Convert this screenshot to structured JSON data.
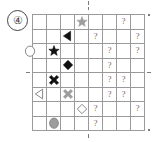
{
  "panel": {
    "label": "④",
    "number": 4
  },
  "grid": {
    "rows": 8,
    "cols": 8,
    "line_color": "#9a9a9a",
    "background": "#ffffff"
  },
  "symbols": {
    "question_mark": "?",
    "question_color": "#6e6e6e",
    "fill_black": "#111111",
    "fill_gray": "#9d9d9d",
    "fill_white": "#ffffff",
    "stroke": "#7a7a7a"
  },
  "cells": [
    {
      "row": 1,
      "col": 4,
      "kind": "star",
      "fill": "gray",
      "name": "gray-star-icon"
    },
    {
      "row": 1,
      "col": 7,
      "kind": "question",
      "text": "?",
      "name": "question-mark"
    },
    {
      "row": 2,
      "col": 3,
      "kind": "triangle-left",
      "fill": "black",
      "name": "black-left-triangle-icon"
    },
    {
      "row": 2,
      "col": 5,
      "kind": "question",
      "text": "?",
      "name": "question-mark"
    },
    {
      "row": 2,
      "col": 8,
      "kind": "question",
      "text": "?",
      "name": "question-mark"
    },
    {
      "row": 3,
      "col": 1,
      "kind": "oval-clipped",
      "fill": "white",
      "name": "white-oval-icon"
    },
    {
      "row": 3,
      "col": 2,
      "kind": "star",
      "fill": "black",
      "name": "black-star-icon"
    },
    {
      "row": 3,
      "col": 6,
      "kind": "question",
      "text": "?",
      "name": "question-mark"
    },
    {
      "row": 3,
      "col": 8,
      "kind": "question",
      "text": "?",
      "name": "question-mark"
    },
    {
      "row": 4,
      "col": 3,
      "kind": "diamond",
      "fill": "black",
      "name": "black-diamond-icon"
    },
    {
      "row": 4,
      "col": 6,
      "kind": "question",
      "text": "?",
      "name": "question-mark"
    },
    {
      "row": 5,
      "col": 2,
      "kind": "cross-x",
      "fill": "black",
      "name": "black-x-cross-icon"
    },
    {
      "row": 5,
      "col": 6,
      "kind": "question",
      "text": "?",
      "name": "question-mark"
    },
    {
      "row": 5,
      "col": 7,
      "kind": "question",
      "text": "?",
      "name": "question-mark"
    },
    {
      "row": 6,
      "col": 1,
      "kind": "triangle-left",
      "fill": "white",
      "name": "white-left-triangle-icon"
    },
    {
      "row": 6,
      "col": 3,
      "kind": "cross-x",
      "fill": "gray",
      "name": "gray-x-cross-icon"
    },
    {
      "row": 6,
      "col": 6,
      "kind": "question",
      "text": "?",
      "name": "question-mark"
    },
    {
      "row": 6,
      "col": 7,
      "kind": "question",
      "text": "?",
      "name": "question-mark"
    },
    {
      "row": 7,
      "col": 4,
      "kind": "diamond",
      "fill": "white",
      "name": "white-diamond-icon"
    },
    {
      "row": 7,
      "col": 5,
      "kind": "question",
      "text": "?",
      "name": "question-mark"
    },
    {
      "row": 7,
      "col": 8,
      "kind": "question",
      "text": "?",
      "name": "question-mark"
    },
    {
      "row": 8,
      "col": 2,
      "kind": "oval",
      "fill": "gray",
      "name": "gray-oval-icon"
    },
    {
      "row": 8,
      "col": 5,
      "kind": "question",
      "text": "?",
      "name": "question-mark"
    }
  ],
  "registration_marks": [
    {
      "name": "reg-top",
      "position": "top-center"
    },
    {
      "name": "reg-top2",
      "position": "top-center-lower"
    },
    {
      "name": "reg-bottom",
      "position": "bottom-center"
    },
    {
      "name": "reg-left",
      "position": "left-middle"
    },
    {
      "name": "reg-right",
      "position": "right-middle"
    },
    {
      "name": "reg-corner-tr",
      "position": "top-right-corner"
    },
    {
      "name": "reg-corner-br",
      "position": "bottom-right-corner"
    }
  ]
}
